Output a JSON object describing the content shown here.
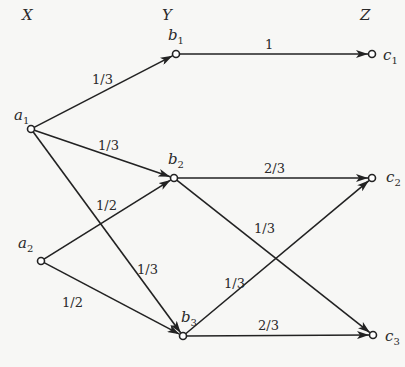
{
  "diagram": {
    "type": "channel-transition-diagram",
    "columns": [
      {
        "label": "X",
        "x": 22,
        "y": 20
      },
      {
        "label": "Y",
        "x": 162,
        "y": 20
      },
      {
        "label": "Z",
        "x": 360,
        "y": 20
      }
    ],
    "nodes": [
      {
        "id": "a1",
        "base": "a",
        "sub": "1",
        "x": 31,
        "y": 129,
        "lx": 14,
        "ly": 120
      },
      {
        "id": "a2",
        "base": "a",
        "sub": "2",
        "x": 41,
        "y": 261,
        "lx": 18,
        "ly": 248
      },
      {
        "id": "b1",
        "base": "b",
        "sub": "1",
        "x": 176,
        "y": 54,
        "lx": 168,
        "ly": 40
      },
      {
        "id": "b2",
        "base": "b",
        "sub": "2",
        "x": 174,
        "y": 178,
        "lx": 168,
        "ly": 164
      },
      {
        "id": "b3",
        "base": "b",
        "sub": "3",
        "x": 183,
        "y": 336,
        "lx": 181,
        "ly": 322
      },
      {
        "id": "c1",
        "base": "c",
        "sub": "1",
        "x": 372,
        "y": 54,
        "lx": 383,
        "ly": 60
      },
      {
        "id": "c2",
        "base": "c",
        "sub": "2",
        "x": 372,
        "y": 178,
        "lx": 386,
        "ly": 182
      },
      {
        "id": "c3",
        "base": "c",
        "sub": "3",
        "x": 373,
        "y": 335,
        "lx": 385,
        "ly": 341
      }
    ],
    "edges": [
      {
        "from": "a1",
        "to": "b1",
        "label": "1/3",
        "lx": 92,
        "ly": 84
      },
      {
        "from": "a1",
        "to": "b2",
        "label": "1/3",
        "lx": 98,
        "ly": 150
      },
      {
        "from": "a1",
        "to": "b3",
        "label": "1/3",
        "lx": 137,
        "ly": 274
      },
      {
        "from": "a2",
        "to": "b2",
        "label": "1/2",
        "lx": 96,
        "ly": 210
      },
      {
        "from": "a2",
        "to": "b3",
        "label": "1/2",
        "lx": 62,
        "ly": 307
      },
      {
        "from": "b1",
        "to": "c1",
        "label": "1",
        "lx": 265,
        "ly": 49
      },
      {
        "from": "b2",
        "to": "c2",
        "label": "2/3",
        "lx": 264,
        "ly": 173
      },
      {
        "from": "b2",
        "to": "c3",
        "label": "1/3",
        "lx": 254,
        "ly": 233
      },
      {
        "from": "b3",
        "to": "c2",
        "label": "1/3",
        "lx": 224,
        "ly": 288
      },
      {
        "from": "b3",
        "to": "c3",
        "label": "2/3",
        "lx": 258,
        "ly": 330
      }
    ]
  }
}
